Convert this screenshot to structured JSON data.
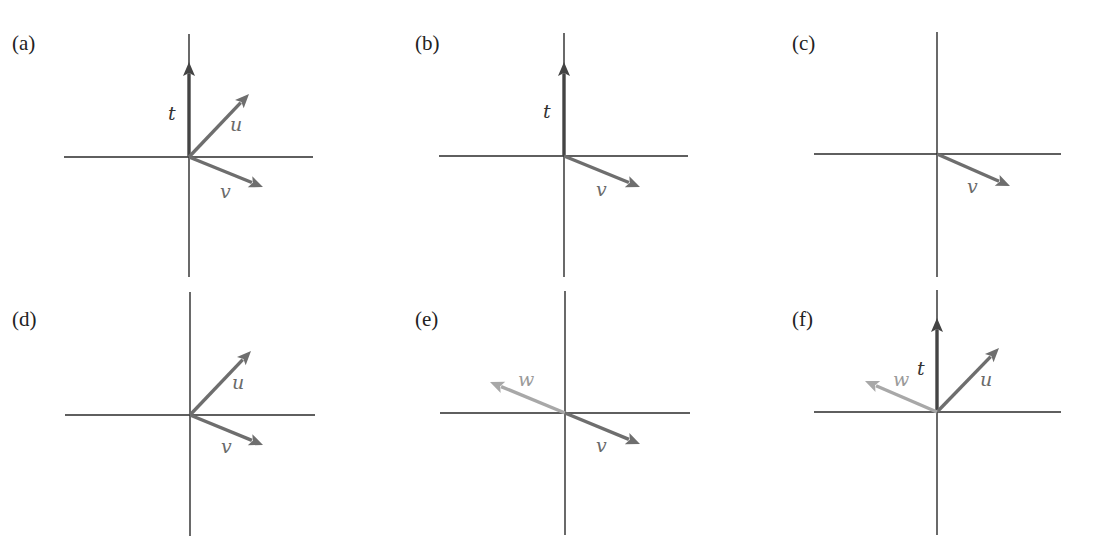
{
  "colors": {
    "axis": "#2a2a2a",
    "t": "#444444",
    "u": "#6e6e6e",
    "v": "#6e6e6e",
    "w": "#a8a8a8",
    "background": "#ffffff"
  },
  "panels": [
    {
      "id": "a",
      "label": "(a)",
      "label_pos": [
        12,
        32
      ],
      "origin": [
        189,
        157
      ],
      "h_axis": [
        64,
        313
      ],
      "v_axis": [
        34,
        277
      ],
      "vectors": [
        {
          "name": "t",
          "tip": [
            189,
            62
          ],
          "label_pos": [
            168,
            120
          ]
        },
        {
          "name": "u",
          "tip": [
            249,
            94
          ],
          "label_pos": [
            230,
            131
          ]
        },
        {
          "name": "v",
          "tip": [
            263,
            187
          ],
          "label_pos": [
            220,
            198
          ]
        }
      ]
    },
    {
      "id": "b",
      "label": "(b)",
      "label_pos": [
        415,
        32
      ],
      "origin": [
        564,
        156
      ],
      "h_axis": [
        439,
        688
      ],
      "v_axis": [
        33,
        277
      ],
      "vectors": [
        {
          "name": "t",
          "tip": [
            564,
            62
          ],
          "label_pos": [
            543,
            118
          ]
        },
        {
          "name": "v",
          "tip": [
            640,
            187
          ],
          "label_pos": [
            596,
            196
          ]
        }
      ]
    },
    {
      "id": "c",
      "label": "(c)",
      "label_pos": [
        792,
        32
      ],
      "origin": [
        937,
        154
      ],
      "h_axis": [
        814,
        1061
      ],
      "v_axis": [
        32,
        277
      ],
      "vectors": [
        {
          "name": "v",
          "tip": [
            1010,
            186
          ],
          "label_pos": [
            967,
            193
          ]
        }
      ]
    },
    {
      "id": "d",
      "label": "(d)",
      "label_pos": [
        12,
        308
      ],
      "origin": [
        190,
        415
      ],
      "h_axis": [
        65,
        315
      ],
      "v_axis": [
        292,
        536
      ],
      "vectors": [
        {
          "name": "u",
          "tip": [
            251,
            351
          ],
          "label_pos": [
            232,
            389
          ]
        },
        {
          "name": "v",
          "tip": [
            263,
            445
          ],
          "label_pos": [
            221,
            453
          ]
        }
      ]
    },
    {
      "id": "e",
      "label": "(e)",
      "label_pos": [
        415,
        308
      ],
      "origin": [
        565,
        413
      ],
      "h_axis": [
        440,
        690
      ],
      "v_axis": [
        291,
        535
      ],
      "vectors": [
        {
          "name": "w",
          "tip": [
            490,
            382
          ],
          "label_pos": [
            518,
            386
          ]
        },
        {
          "name": "v",
          "tip": [
            640,
            444
          ],
          "label_pos": [
            596,
            452
          ]
        }
      ]
    },
    {
      "id": "f",
      "label": "(f)",
      "label_pos": [
        792,
        308
      ],
      "origin": [
        937,
        412
      ],
      "h_axis": [
        814,
        1061
      ],
      "v_axis": [
        290,
        535
      ],
      "vectors": [
        {
          "name": "t",
          "tip": [
            937,
            318
          ],
          "label_pos": [
            917,
            375
          ]
        },
        {
          "name": "u",
          "tip": [
            999,
            348
          ],
          "label_pos": [
            980,
            386
          ]
        },
        {
          "name": "w",
          "tip": [
            865,
            381
          ],
          "label_pos": [
            893,
            386
          ]
        }
      ]
    }
  ]
}
